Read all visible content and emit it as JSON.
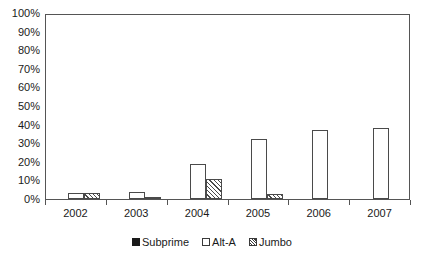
{
  "chart_data": {
    "type": "bar",
    "title": "",
    "subtitle": "",
    "xlabel": "",
    "ylabel": "",
    "categories": [
      "2002",
      "2003",
      "2004",
      "2005",
      "2006",
      "2007"
    ],
    "series": [
      {
        "name": "Subprime",
        "values": [
          0,
          0,
          0,
          0,
          0,
          0
        ],
        "style": "solid-black",
        "color": "#1a1a1a"
      },
      {
        "name": "Alt-A",
        "values": [
          3,
          4,
          19,
          32,
          37,
          38
        ],
        "style": "open-white",
        "color": "#ffffff"
      },
      {
        "name": "Jumbo",
        "values": [
          3,
          1,
          10.5,
          2.5,
          0,
          0
        ],
        "style": "diagonal-hatch",
        "color": "#ffffff"
      }
    ],
    "ylim": [
      0,
      100
    ],
    "ytick_labels": [
      "0%",
      "10%",
      "20%",
      "30%",
      "40%",
      "50%",
      "60%",
      "70%",
      "80%",
      "90%",
      "100%"
    ],
    "ytick_values": [
      0,
      10,
      20,
      30,
      40,
      50,
      60,
      70,
      80,
      90,
      100
    ],
    "grid": false,
    "legend_position": "bottom",
    "frame": true,
    "value_unit": "percent"
  },
  "legend": {
    "entries": [
      {
        "label": "Subprime",
        "swatch": "solid-square-icon"
      },
      {
        "label": "Alt-A",
        "swatch": "open-square-icon"
      },
      {
        "label": "Jumbo",
        "swatch": "hatched-square-icon"
      }
    ]
  },
  "colors": {
    "axis": "#555555",
    "text": "#1a1a1a",
    "background": "#ffffff",
    "bar_outline": "#4a4a4a",
    "subprime": "#1a1a1a"
  }
}
